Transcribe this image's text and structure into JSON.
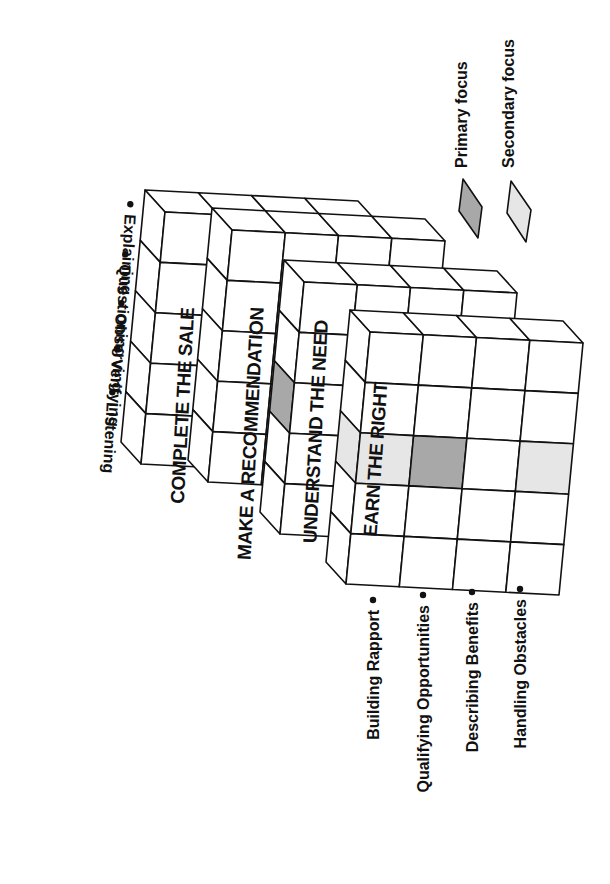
{
  "diagram": {
    "colors": {
      "line": "#111111",
      "cell": "#ffffff",
      "primary": "#a8a8a8",
      "secondary": "#e6e6e6"
    },
    "slabs": [
      {
        "label": "COMPLETE THE SALE"
      },
      {
        "label": "MAKE A RECOMMENDATION"
      },
      {
        "label": "UNDERSTAND THE NEED"
      },
      {
        "label": "EARN THE RIGHT"
      }
    ],
    "top_axis_items": [
      {
        "label": "Listening"
      },
      {
        "label": "Verifying"
      },
      {
        "label": "Observing"
      },
      {
        "label": "Questioning"
      },
      {
        "label": "Explaining"
      }
    ],
    "bottom_axis_items": [
      {
        "label": "Building Rapport"
      },
      {
        "label": "Qualifying Opportunities"
      },
      {
        "label": "Describing Benefits"
      },
      {
        "label": "Handling Obstacles"
      }
    ],
    "legend": [
      {
        "label": "Primary focus",
        "color": "#a8a8a8"
      },
      {
        "label": "Secondary focus",
        "color": "#e6e6e6"
      }
    ],
    "highlighted_cells": [
      {
        "slab": "EARN THE RIGHT",
        "face": "front",
        "row": "Observing",
        "column": "Building Rapport",
        "focus": "secondary"
      },
      {
        "slab": "EARN THE RIGHT",
        "face": "front",
        "row": "Observing",
        "column": "Qualifying Opportunities",
        "focus": "primary"
      },
      {
        "slab": "EARN THE RIGHT",
        "face": "front",
        "row": "Observing",
        "column": "Handling Obstacles",
        "focus": "secondary"
      },
      {
        "slab": "EARN THE RIGHT",
        "face": "side",
        "row": "Observing",
        "focus": "secondary"
      },
      {
        "slab": "UNDERSTAND THE NEED",
        "face": "side",
        "row": "Observing",
        "focus": "primary"
      }
    ]
  }
}
